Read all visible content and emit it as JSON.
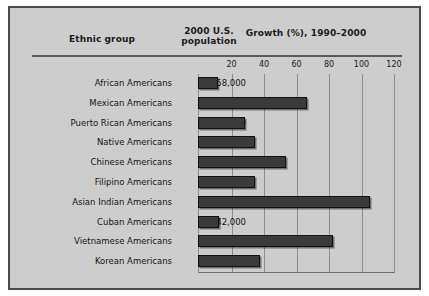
{
  "figure": {
    "panel_color": "#cdcdcd",
    "border_color": "#4b4b4b",
    "bar_color": "#3a3a3a"
  },
  "headers": {
    "ethnic_group": "Ethnic group",
    "population_line1": "2000 U.S.",
    "population_line2": "population",
    "growth": "Growth (%), 1990–2000"
  },
  "chart_data": {
    "type": "bar",
    "orientation": "horizontal",
    "title": "Growth (%), 1990–2000",
    "xlabel": "Growth (%), 1990–2000",
    "ylabel": "Ethnic group",
    "xlim": [
      0,
      120
    ],
    "ticks": [
      20,
      40,
      60,
      80,
      100,
      120
    ],
    "tick_labels": [
      "20",
      "40",
      "60",
      "80",
      "100",
      "120"
    ],
    "grid": true,
    "legend": "none",
    "categories": [
      "African Americans",
      "Mexican Americans",
      "Puerto Rican Americans",
      "Native Americans",
      "Chinese Americans",
      "Filipino Americans",
      "Asian Indian Americans",
      "Cuban Americans",
      "Vietnamese Americans",
      "Korean Americans"
    ],
    "populations": [
      "34,658,000",
      "20,641,000",
      "3,406,000",
      "2,476,000",
      "2,433,000",
      "1,850,000",
      "1,679,000",
      "1,242,000",
      "1,123,000",
      "1,077,000"
    ],
    "values": [
      12,
      67,
      29,
      35,
      54,
      35,
      106,
      13,
      83,
      38
    ]
  }
}
